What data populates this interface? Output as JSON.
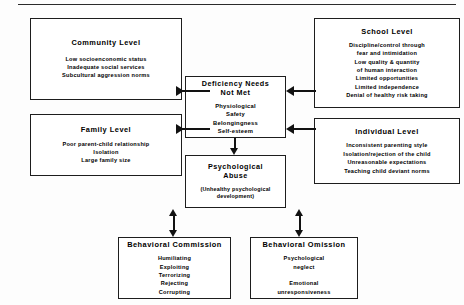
{
  "diagram": {
    "boxes": {
      "community": {
        "title": "Community Level",
        "lines": "Low socioenconomic status\nInadequate social services\nSubcultural aggression norms"
      },
      "family": {
        "title": "Family Level",
        "lines": "Poor parent-child relationship\nIsolation\nLarge family size"
      },
      "school": {
        "title": "School Level",
        "lines": "Discipline/control through\nfear and intimidation\nLow quality & quantity\nof human interaction\nLimited opportunities\nLimited independence\nDenial of healthy risk taking"
      },
      "individual": {
        "title": "Individual Level",
        "lines": "Inconsistent parenting style\nIsolation/rejection of the child\nUnreasonable expectations\nTeaching child deviant norms"
      },
      "center": {
        "title": "Deficiency Needs\nNot Met",
        "lines": "Physiological\nSafety\nBelongingness\nSelf-esteem"
      },
      "abuse": {
        "title": "Psychological\nAbuse",
        "sub": "(Unhealthy psychological\ndevelopment)"
      },
      "commission": {
        "title": "Behavioral Commission",
        "lines": "Humiliating\nExploiting\nTerrorizing\nRejecting\nCorrupting"
      },
      "omission": {
        "title": "Behavioral Omission",
        "lines": "Psychological\nneglect\n\nEmotional\nunresponsiveness"
      }
    }
  }
}
